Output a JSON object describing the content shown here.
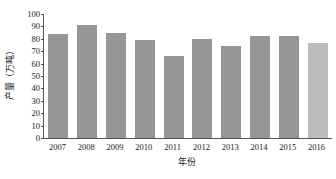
{
  "chart_data": {
    "type": "bar",
    "title": "",
    "xlabel": "年份",
    "ylabel": "产量（万吨）",
    "categories": [
      "2007",
      "2008",
      "2009",
      "2010",
      "2011",
      "2012",
      "2013",
      "2014",
      "2015",
      "2016"
    ],
    "values": [
      84,
      91,
      85,
      79,
      66,
      80,
      74.5,
      82,
      82,
      77
    ],
    "ylim": [
      0,
      100
    ],
    "ytick_labels": [
      "100",
      "90",
      "80",
      "70",
      "60",
      "50",
      "40",
      "30",
      "20",
      "10",
      "0"
    ],
    "ytick_values": [
      100,
      90,
      80,
      70,
      60,
      50,
      40,
      30,
      20,
      10,
      0
    ],
    "ytick_step": 10,
    "grid": false,
    "legend": "none",
    "bar_color": "#969696",
    "highlight_color": "#bcbcbc",
    "highlight_index": 9,
    "axis_color": "#555555",
    "background": "#ffffff"
  }
}
